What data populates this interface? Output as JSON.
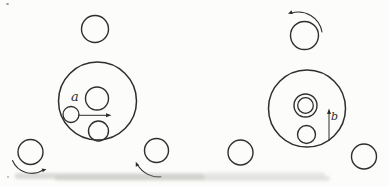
{
  "figure": {
    "background": "#fcfcfa",
    "ink": "#2e2e2e",
    "labels": {
      "a": {
        "text": "a"
      },
      "b": {
        "text": "b"
      }
    },
    "left_diagram": {
      "name": "left-friction-drive",
      "circles": [
        {
          "name": "top-roller",
          "cx": 95,
          "cy": 29,
          "r": 13.5,
          "sw": 1.4
        },
        {
          "name": "drive-disk",
          "cx": 97.5,
          "cy": 101,
          "r": 39,
          "sw": 1.5
        },
        {
          "name": "planet-mid",
          "cx": 97,
          "cy": 98.5,
          "r": 11.5,
          "sw": 1.4
        },
        {
          "name": "planet-left",
          "cx": 71,
          "cy": 114.5,
          "r": 8,
          "sw": 1.3
        },
        {
          "name": "planet-bottom",
          "cx": 98.5,
          "cy": 131,
          "r": 10,
          "sw": 1.4
        },
        {
          "name": "bottom-left-roller",
          "cx": 30.5,
          "cy": 152,
          "r": 12.5,
          "sw": 1.4
        },
        {
          "name": "bottom-right-roller",
          "cx": 156.5,
          "cy": 150.5,
          "r": 12,
          "sw": 1.4
        }
      ],
      "arrows": [
        {
          "name": "velocity-arrow-a",
          "x1": 78,
          "y1": 115.3,
          "x2": 111.5,
          "y2": 115.3
        }
      ],
      "arcs": [
        {
          "name": "rotation-arrow-bottom-left",
          "d": "M 12.5 160.5 A 21 21 0 0 0 43.5 169.8",
          "tip": {
            "x": 46.5,
            "y": 169.2,
            "angle": -16
          }
        },
        {
          "name": "rotation-arrow-bottom-right",
          "d": "M 161 176.8 A 25 25 0 0 1 137.5 164.8",
          "tip": {
            "x": 135.8,
            "y": 161.8,
            "angle": -112
          }
        }
      ]
    },
    "right_diagram": {
      "name": "right-friction-drive",
      "circles": [
        {
          "name": "top-roller",
          "cx": 304.5,
          "cy": 35.5,
          "r": 14,
          "sw": 1.4
        },
        {
          "name": "drive-disk",
          "cx": 307,
          "cy": 108.5,
          "r": 38.5,
          "sw": 1.5
        },
        {
          "name": "hub-outer",
          "cx": 305.5,
          "cy": 105.5,
          "r": 11.5,
          "sw": 1.4
        },
        {
          "name": "hub-inner",
          "cx": 305.5,
          "cy": 105.5,
          "r": 7.8,
          "sw": 1.3
        },
        {
          "name": "planet-bottom",
          "cx": 306.5,
          "cy": 134.5,
          "r": 9,
          "sw": 1.4
        },
        {
          "name": "bottom-left-roller",
          "cx": 240.5,
          "cy": 152.5,
          "r": 12.5,
          "sw": 1.4
        },
        {
          "name": "bottom-right-roller",
          "cx": 364,
          "cy": 156.5,
          "r": 12.5,
          "sw": 1.4
        }
      ],
      "arrows": [
        {
          "name": "velocity-arrow-b",
          "x1": 329,
          "y1": 141,
          "x2": 329,
          "y2": 108.5
        }
      ],
      "arcs": [
        {
          "name": "rotation-arrow-top",
          "d": "M 322 32 A 24 24 0 0 0 291 13.2",
          "tip": {
            "x": 288,
            "y": 13.8,
            "angle": 158
          }
        }
      ]
    },
    "artifacts": {
      "specks": [
        {
          "x": 6,
          "y": 3,
          "w": 3,
          "h": 2,
          "c": "#9a9a9a"
        },
        {
          "x": 7,
          "y": 176,
          "w": 2,
          "h": 2,
          "c": "#b5b5b5"
        }
      ],
      "smudges": [
        {
          "x": 15,
          "y": 173,
          "w": 190,
          "h": 6,
          "c": "rgba(158,158,155,0.35)"
        },
        {
          "x": 55,
          "y": 176,
          "w": 275,
          "h": 5,
          "c": "rgba(168,168,165,0.28)"
        },
        {
          "x": 205,
          "y": 172,
          "w": 120,
          "h": 5,
          "c": "rgba(175,175,172,0.22)"
        }
      ]
    }
  }
}
